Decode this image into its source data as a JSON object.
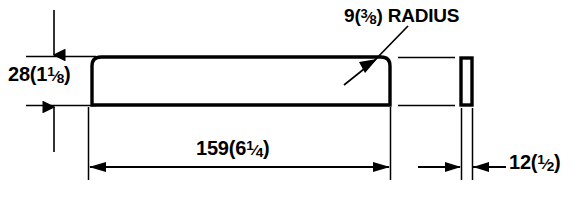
{
  "drawing": {
    "title": "Rounded bar profile dimensioned drawing",
    "stroke_color": "#000000",
    "background_color": "#ffffff",
    "dimensions": {
      "height": {
        "metric": "28",
        "imperial_whole": "1",
        "imperial_num": "1",
        "imperial_den": "8",
        "open_paren": "(",
        "close_paren": ")",
        "slash": "⁄",
        "full_text": "28(1 1/8)"
      },
      "length": {
        "metric": "159",
        "imperial_whole": "6",
        "imperial_num": "1",
        "imperial_den": "4",
        "open_paren": "(",
        "close_paren": ")",
        "slash": "⁄",
        "full_text": "159(6 1/4)"
      },
      "radius": {
        "metric": "9",
        "imperial_whole": "",
        "imperial_num": "3",
        "imperial_den": "8",
        "open_paren": "(",
        "close_paren": ")",
        "slash": "⁄",
        "note": "RADIUS",
        "full_text": "9(3/8) RADIUS"
      },
      "thickness": {
        "metric": "12",
        "imperial_whole": "",
        "imperial_num": "1",
        "imperial_den": "2",
        "open_paren": "(",
        "close_paren": ")",
        "slash": "⁄",
        "full_text": "12(1/2)"
      }
    }
  }
}
